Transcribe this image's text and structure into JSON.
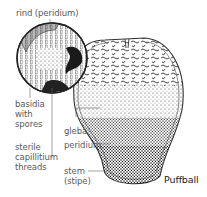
{
  "diagram": {
    "title": "Puffball",
    "labels": {
      "rind": "rind (peridium)",
      "basidia_1": "basidia",
      "basidia_2": "with",
      "basidia_3": "spores",
      "sterile_1": "sterile",
      "sterile_2": "capillitium",
      "sterile_3": "threads",
      "gleba": "gleba",
      "peridium": "peridium",
      "stem_1": "stem",
      "stem_2": "(stipe)"
    },
    "colors": {
      "ink": "#222222",
      "label": "#5a5a5a",
      "rind_fill": "#b8b8b8",
      "background": "#ffffff"
    }
  }
}
